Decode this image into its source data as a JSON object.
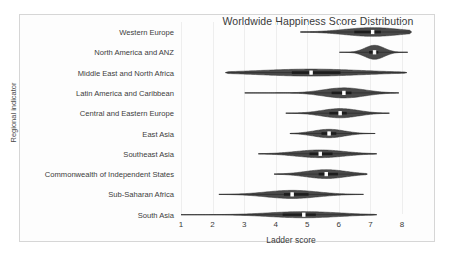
{
  "figure": {
    "title": "Worldwide Happiness Score Distribution",
    "xlabel": "Ladder score",
    "ylabel": "Regional indicator",
    "frame_color": "#d6d6d6",
    "violin_fill": "#4a4a4a",
    "violin_edge": "#2f2f2f",
    "median_color": "#ffffff"
  },
  "chart_data": {
    "type": "violin",
    "title": "Worldwide Happiness Score Distribution",
    "xlabel": "Ladder score",
    "ylabel": "Regional indicator",
    "xlim": [
      0.55,
      8.6
    ],
    "xticks": [
      1,
      2,
      3,
      4,
      5,
      6,
      7,
      8
    ],
    "xtick_labels": [
      "1",
      "2",
      "3",
      "4",
      "5",
      "6",
      "7",
      "8"
    ],
    "grid": false,
    "legend": "none",
    "orientation": "horizontal",
    "categories": [
      "Western Europe",
      "North America and ANZ",
      "Middle East and North Africa",
      "Latin America and Caribbean",
      "Central and Eastern Europe",
      "East Asia",
      "Southeast Asia",
      "Commonwealth of Independent States",
      "Sub-Saharan Africa",
      "South Asia"
    ],
    "series": [
      {
        "name": "Western Europe",
        "min": 4.78,
        "q1": 6.49,
        "median": 7.07,
        "q3": 7.33,
        "max": 8.3,
        "peak": 7.07,
        "width": 0.62
      },
      {
        "name": "North America and ANZ",
        "min": 6.02,
        "q1": 6.96,
        "median": 7.13,
        "q3": 7.25,
        "max": 8.18,
        "peak": 7.13,
        "width": 1.0
      },
      {
        "name": "Middle East and North Africa",
        "min": 2.41,
        "q1": 4.51,
        "median": 5.12,
        "q3": 6.05,
        "max": 8.15,
        "peak": 5.12,
        "width": 0.5
      },
      {
        "name": "Latin America and Caribbean",
        "min": 3.02,
        "q1": 5.77,
        "median": 6.16,
        "q3": 6.4,
        "max": 7.9,
        "peak": 6.16,
        "width": 0.72
      },
      {
        "name": "Central and Eastern Europe",
        "min": 4.32,
        "q1": 5.7,
        "median": 6.04,
        "q3": 6.25,
        "max": 7.6,
        "peak": 6.04,
        "width": 0.66
      },
      {
        "name": "East Asia",
        "min": 4.45,
        "q1": 5.45,
        "median": 5.69,
        "q3": 5.92,
        "max": 7.15,
        "peak": 5.69,
        "width": 0.6
      },
      {
        "name": "Southeast Asia",
        "min": 3.45,
        "q1": 5.07,
        "median": 5.41,
        "q3": 5.8,
        "max": 7.2,
        "peak": 5.41,
        "width": 0.55
      },
      {
        "name": "Commonwealth of Independent States",
        "min": 3.95,
        "q1": 5.36,
        "median": 5.6,
        "q3": 5.97,
        "max": 6.9,
        "peak": 5.6,
        "width": 0.63
      },
      {
        "name": "Sub-Saharan Africa",
        "min": 2.2,
        "q1": 4.26,
        "median": 4.52,
        "q3": 5.04,
        "max": 6.78,
        "peak": 4.52,
        "width": 0.58
      },
      {
        "name": "South Asia",
        "min": 1.0,
        "q1": 4.22,
        "median": 4.89,
        "q3": 5.27,
        "max": 7.2,
        "peak": 4.89,
        "width": 0.44
      }
    ]
  }
}
